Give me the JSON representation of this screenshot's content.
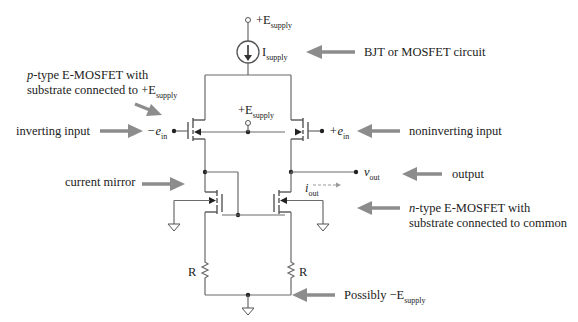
{
  "diagram": {
    "supply_top": {
      "prefix": "+E",
      "sub": "supply"
    },
    "current_source": {
      "prefix": "I",
      "sub": "supply"
    },
    "supply_mid": {
      "prefix": "+E",
      "sub": "supply"
    },
    "inv_input_node": {
      "prefix": "−e",
      "sub": "in"
    },
    "noninv_input_node": {
      "prefix": "+e",
      "sub": "in"
    },
    "vout_node": {
      "prefix": "v",
      "sub": "out"
    },
    "iout_label": {
      "prefix": "i",
      "sub": "out"
    },
    "resistor_left": "R",
    "resistor_right": "R",
    "annotations": {
      "bjt_or_mosfet": "BJT or MOSFET circuit",
      "ptype_line1_italic": "p",
      "ptype_line1_rest": "-type E-MOSFET with",
      "ptype_line2_prefix": "substrate connected to +E",
      "ptype_line2_sub": "supply",
      "inverting_input": "inverting input",
      "noninverting_input": "noninverting input",
      "output": "output",
      "current_mirror": "current mirror",
      "ntype_line1_italic": "n",
      "ntype_line1_rest": "-type E-MOSFET with",
      "ntype_line2": "substrate connected to common",
      "possibly_prefix": "Possibly  −E",
      "possibly_sub": "supply"
    },
    "colors": {
      "annotation_arrow": "#8c8c8c",
      "wire": "#6a6a6a",
      "text": "#222222"
    }
  }
}
